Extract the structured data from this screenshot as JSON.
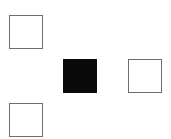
{
  "diagram": {
    "colors": {
      "outline": "#6e6e6e",
      "filled": "#0a0a0a",
      "empty": "#ffffff",
      "background": "#ffffff"
    },
    "squares": [
      {
        "id": "top-left",
        "state": "empty",
        "x": 9,
        "y": 15
      },
      {
        "id": "center",
        "state": "filled",
        "x": 63,
        "y": 59
      },
      {
        "id": "right",
        "state": "empty",
        "x": 128,
        "y": 59
      },
      {
        "id": "bottom-left",
        "state": "empty",
        "x": 9,
        "y": 103
      }
    ]
  }
}
